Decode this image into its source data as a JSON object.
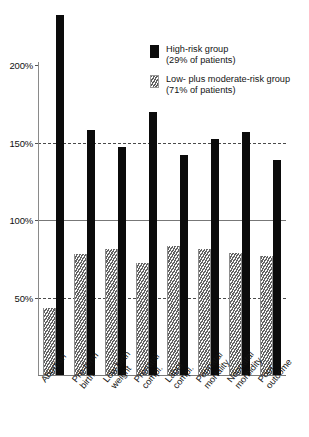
{
  "chart_data": {
    "type": "bar",
    "title": "",
    "xlabel": "",
    "ylabel": "",
    "ylim": [
      0,
      240
    ],
    "grid": "horizontal-partial",
    "legend_position": "inside-top-right",
    "categories": [
      "Abortion",
      "Pre-term birth",
      "Low birth weight",
      "Prenatal compl.",
      "Labor compl.",
      "Perinatal mortality",
      "Neonatal morbidity",
      "Poor outcome"
    ],
    "category_lines": [
      [
        "Abortion"
      ],
      [
        "Pre-term",
        "birth"
      ],
      [
        "Low birth",
        "weight"
      ],
      [
        "Prenatal",
        "compl."
      ],
      [
        "Labor",
        "compl."
      ],
      [
        "Perinatal",
        "mortality"
      ],
      [
        "Neonatal",
        "morbidity"
      ],
      [
        "Poor",
        "outcome"
      ]
    ],
    "series": [
      {
        "name": "Low- plus moderate-risk group",
        "key": "low",
        "values": [
          43,
          78,
          81,
          72,
          83,
          81,
          79,
          77
        ],
        "color": "#bcbcbc",
        "pattern": "diagonal-hatch"
      },
      {
        "name": "High-risk group",
        "key": "high",
        "values": [
          232,
          158,
          147,
          170,
          142,
          152,
          157,
          139
        ],
        "color": "#0b0b0b",
        "pattern": "solid"
      }
    ],
    "yticks": [
      {
        "value": 50,
        "label": "50%",
        "line": "dashed"
      },
      {
        "value": 100,
        "label": "100%",
        "line": "solid"
      },
      {
        "value": 150,
        "label": "150%",
        "line": "dashed"
      },
      {
        "value": 200,
        "label": "200%",
        "line": "none"
      }
    ]
  },
  "legend": {
    "entries": [
      {
        "swatch": "high",
        "line1": "High-risk group",
        "line2": "(29% of patients)"
      },
      {
        "swatch": "low",
        "line1": "Low- plus moderate-risk group",
        "line2": "(71% of patients)"
      }
    ]
  }
}
